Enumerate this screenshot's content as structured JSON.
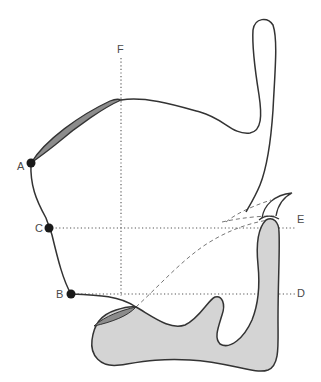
{
  "diagram": {
    "type": "anatomical-profile-sagittal",
    "colors": {
      "outline": "#333333",
      "fill_light": "#d4d4d4",
      "fill_dark": "#8c8c8c",
      "dots": "#1a1a1a",
      "guide_lines": "#555555",
      "label_text": "#4a4a4a"
    },
    "labels": {
      "A": "A",
      "B": "B",
      "C": "C",
      "D": "D",
      "E": "E",
      "F": "F"
    },
    "points": [
      {
        "id": "A",
        "x": 31,
        "y": 163
      },
      {
        "id": "C",
        "x": 49,
        "y": 228
      },
      {
        "id": "B",
        "x": 71,
        "y": 294
      }
    ],
    "guides": [
      {
        "id": "F",
        "orientation": "vertical",
        "x": 121,
        "from": 58,
        "to": 296
      },
      {
        "id": "E",
        "orientation": "horizontal",
        "y": 228,
        "from": 52,
        "to": 295
      },
      {
        "id": "D",
        "orientation": "horizontal",
        "y": 294,
        "from": 74,
        "to": 295
      }
    ]
  }
}
